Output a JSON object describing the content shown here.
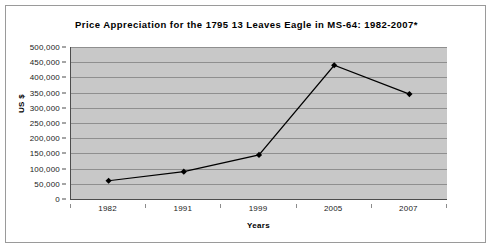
{
  "chart_data": {
    "type": "line",
    "title": "Price Appreciation for the 1795 13 Leaves Eagle in MS-64: 1982-2007*",
    "xlabel": "Years",
    "ylabel": "US $",
    "categories": [
      "1982",
      "1991",
      "1999",
      "2005",
      "2007"
    ],
    "values": [
      60000,
      90000,
      145000,
      440000,
      345000
    ],
    "series": [
      {
        "name": "Price",
        "values": [
          60000,
          90000,
          145000,
          440000,
          345000
        ]
      }
    ],
    "ylim": [
      0,
      500000
    ],
    "ytick_labels": [
      "500,000",
      "450,000",
      "400,000",
      "350,000",
      "300,000",
      "250,000",
      "200,000",
      "150,000",
      "100,000",
      "50,000",
      "0"
    ],
    "ytick_values": [
      500000,
      450000,
      400000,
      350000,
      300000,
      250000,
      200000,
      150000,
      100000,
      50000,
      0
    ],
    "ytick_step": 50000,
    "grid": true,
    "grid_orientation": "horizontal",
    "legend": false,
    "legend_position": "none",
    "marker": "diamond",
    "colors": {
      "plot_background": "#c8c8c8",
      "gridline": "#8f8f8f",
      "series_line": "#000000",
      "marker_fill": "#000000",
      "axis": "#4d4d4d",
      "frame_border": "#9a9a9a",
      "page_background": "#ffffff",
      "text": "#1a1a1a"
    },
    "footnote_marker": "*"
  }
}
